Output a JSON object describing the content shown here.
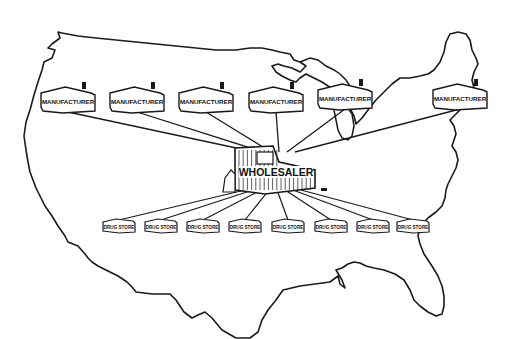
{
  "diagram": {
    "type": "distribution-network-map",
    "map": "United States outline",
    "colors": {
      "ink": "#1a1a1a",
      "background": "#ffffff"
    },
    "central_node": {
      "label": "WHOLESALER",
      "x": 275,
      "y": 172
    },
    "manufacturers": [
      {
        "label": "MANUFACTURER",
        "x": 68,
        "y": 100
      },
      {
        "label": "MANUFACTURER",
        "x": 137,
        "y": 100
      },
      {
        "label": "MANUFACTURER",
        "x": 206,
        "y": 100
      },
      {
        "label": "MANUFACTURER",
        "x": 276,
        "y": 100
      },
      {
        "label": "MANUFACTURER",
        "x": 345,
        "y": 97
      },
      {
        "label": "MANUFACTURER",
        "x": 460,
        "y": 97
      }
    ],
    "drug_stores": [
      {
        "label": "DRUG STORE",
        "x": 119,
        "y": 226
      },
      {
        "label": "DRUG STORE",
        "x": 161,
        "y": 226
      },
      {
        "label": "DRUG STORE",
        "x": 203,
        "y": 226
      },
      {
        "label": "DRUG STORE",
        "x": 245,
        "y": 226
      },
      {
        "label": "DRUG STORE",
        "x": 288,
        "y": 226
      },
      {
        "label": "DRUG STORE",
        "x": 331,
        "y": 226
      },
      {
        "label": "DRUG STORE",
        "x": 373,
        "y": 226
      },
      {
        "label": "DRUG STORE",
        "x": 413,
        "y": 226
      }
    ]
  }
}
